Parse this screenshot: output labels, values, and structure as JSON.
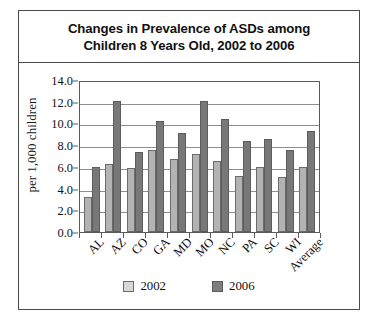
{
  "chart_data": {
    "type": "bar",
    "title": "Changes in Prevalence of ASDs among Children 8 Years Old, 2002 to 2006",
    "title_lines": [
      "Changes in Prevalence of ASDs among",
      "Children 8 Years Old, 2002 to 2006"
    ],
    "xlabel": "",
    "ylabel": "per 1,000 children",
    "ylim": [
      0.0,
      14.0
    ],
    "ytick_step": 2.0,
    "ytick_labels": [
      "14.0",
      "12.0",
      "10.0",
      "8.0",
      "6.0",
      "4.0",
      "2.0",
      "0.0"
    ],
    "ytick_values": [
      14.0,
      12.0,
      10.0,
      8.0,
      6.0,
      4.0,
      2.0,
      0.0
    ],
    "grid": true,
    "legend_position": "bottom-center",
    "categories": [
      "AL",
      "AZ",
      "CO",
      "GA",
      "MD",
      "MO",
      "NC",
      "PA",
      "SC",
      "WI",
      "Average"
    ],
    "series": [
      {
        "name": "2002",
        "color": "#b3b3b3",
        "values": [
          3.2,
          6.3,
          5.9,
          7.6,
          6.7,
          7.2,
          6.5,
          5.2,
          6.0,
          5.1,
          6.0
        ]
      },
      {
        "name": "2006",
        "color": "#787878",
        "values": [
          6.0,
          12.1,
          7.4,
          10.2,
          9.1,
          12.1,
          10.4,
          8.4,
          8.6,
          7.6,
          9.3
        ]
      }
    ]
  },
  "legend": {
    "items": [
      {
        "label": "2002"
      },
      {
        "label": "2006"
      }
    ]
  },
  "colors": {
    "series_2002": "#b3b3b3",
    "series_2006": "#787878",
    "frame": "#4a4a4a",
    "gridline": "#8e8e8e",
    "text": "#111111"
  }
}
